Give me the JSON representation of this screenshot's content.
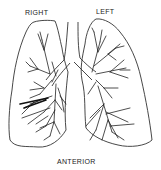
{
  "diagram": {
    "labels": {
      "right": "RIGHT",
      "left": "LEFT",
      "anterior": "ANTERIOR"
    },
    "colors": {
      "line": "#222222",
      "background": "#ffffff"
    }
  }
}
